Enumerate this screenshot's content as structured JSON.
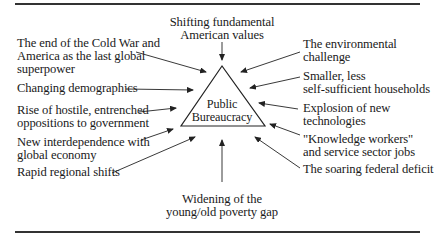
{
  "diagram": {
    "center": {
      "line1": "Public",
      "line2": "Bureaucracy"
    },
    "top": {
      "line1": "Shifting fundamental",
      "line2": "American values"
    },
    "bottom": {
      "line1": "Widening of the",
      "line2": "young/old poverty gap"
    },
    "left": [
      {
        "lines": [
          "The end of the Cold War and",
          "America as the last global",
          "superpower"
        ]
      },
      {
        "lines": [
          "Changing demographics"
        ]
      },
      {
        "lines": [
          "Rise of hostile, entrenched",
          "oppositions to government"
        ]
      },
      {
        "lines": [
          "New interdependence with",
          "global economy"
        ]
      },
      {
        "lines": [
          "Rapid regional shifts"
        ]
      }
    ],
    "right": [
      {
        "lines": [
          "The environmental",
          "challenge"
        ]
      },
      {
        "lines": [
          "Smaller, less",
          "self-sufficient households"
        ]
      },
      {
        "lines": [
          "Explosion of new",
          "technologies"
        ]
      },
      {
        "lines": [
          "\"Knowledge workers\"",
          "and service sector jobs"
        ]
      },
      {
        "lines": [
          "The soaring federal deficit"
        ]
      }
    ]
  }
}
